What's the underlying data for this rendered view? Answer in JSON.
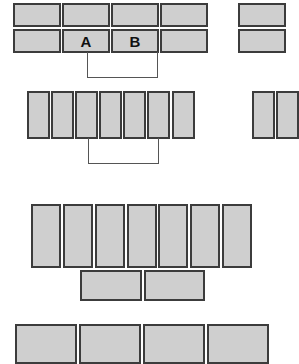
{
  "diagram": {
    "colors": {
      "box_fill": "#cfcfcf",
      "box_border": "#3c3c3c",
      "connector": "#555555",
      "background": "#ffffff"
    },
    "groups": [
      {
        "name": "top-grid",
        "boxes": [
          {
            "x": 13,
            "y": 3,
            "w": 48,
            "h": 24,
            "label": ""
          },
          {
            "x": 62,
            "y": 3,
            "w": 48,
            "h": 24,
            "label": ""
          },
          {
            "x": 111,
            "y": 3,
            "w": 48,
            "h": 24,
            "label": ""
          },
          {
            "x": 160,
            "y": 3,
            "w": 48,
            "h": 24,
            "label": ""
          },
          {
            "x": 13,
            "y": 29,
            "w": 48,
            "h": 24,
            "label": ""
          },
          {
            "x": 62,
            "y": 29,
            "w": 48,
            "h": 24,
            "label": "A"
          },
          {
            "x": 111,
            "y": 29,
            "w": 48,
            "h": 24,
            "label": "B"
          },
          {
            "x": 160,
            "y": 29,
            "w": 48,
            "h": 24,
            "label": ""
          },
          {
            "x": 238,
            "y": 3,
            "w": 48,
            "h": 24,
            "label": ""
          },
          {
            "x": 238,
            "y": 29,
            "w": 48,
            "h": 24,
            "label": ""
          }
        ],
        "connector": {
          "x1": 87,
          "x2": 158,
          "y_top": 52,
          "y_bottom": 78
        }
      },
      {
        "name": "tall-row",
        "boxes": [
          {
            "x": 27,
            "y": 91,
            "w": 23,
            "h": 48,
            "label": ""
          },
          {
            "x": 51,
            "y": 91,
            "w": 23,
            "h": 48,
            "label": ""
          },
          {
            "x": 75,
            "y": 91,
            "w": 23,
            "h": 48,
            "label": ""
          },
          {
            "x": 99,
            "y": 91,
            "w": 23,
            "h": 48,
            "label": ""
          },
          {
            "x": 123,
            "y": 91,
            "w": 23,
            "h": 48,
            "label": ""
          },
          {
            "x": 147,
            "y": 91,
            "w": 23,
            "h": 48,
            "label": ""
          },
          {
            "x": 172,
            "y": 91,
            "w": 23,
            "h": 48,
            "label": ""
          },
          {
            "x": 252,
            "y": 91,
            "w": 23,
            "h": 48,
            "label": ""
          },
          {
            "x": 276,
            "y": 91,
            "w": 23,
            "h": 48,
            "label": ""
          }
        ],
        "connector": {
          "x1": 88,
          "x2": 159,
          "y_top": 138,
          "y_bottom": 164
        }
      },
      {
        "name": "large-row",
        "boxes": [
          {
            "x": 31,
            "y": 204,
            "w": 30,
            "h": 64,
            "label": ""
          },
          {
            "x": 63,
            "y": 204,
            "w": 30,
            "h": 64,
            "label": ""
          },
          {
            "x": 95,
            "y": 204,
            "w": 30,
            "h": 64,
            "label": ""
          },
          {
            "x": 127,
            "y": 204,
            "w": 30,
            "h": 64,
            "label": ""
          },
          {
            "x": 158,
            "y": 204,
            "w": 30,
            "h": 64,
            "label": ""
          },
          {
            "x": 190,
            "y": 204,
            "w": 30,
            "h": 64,
            "label": ""
          },
          {
            "x": 222,
            "y": 204,
            "w": 30,
            "h": 64,
            "label": ""
          },
          {
            "x": 80,
            "y": 270,
            "w": 62,
            "h": 31,
            "label": ""
          },
          {
            "x": 144,
            "y": 270,
            "w": 61,
            "h": 31,
            "label": ""
          }
        ]
      },
      {
        "name": "bottom-row",
        "boxes": [
          {
            "x": 15,
            "y": 324,
            "w": 62,
            "h": 40,
            "label": ""
          },
          {
            "x": 79,
            "y": 324,
            "w": 62,
            "h": 40,
            "label": ""
          },
          {
            "x": 143,
            "y": 324,
            "w": 62,
            "h": 40,
            "label": ""
          },
          {
            "x": 207,
            "y": 324,
            "w": 62,
            "h": 40,
            "label": ""
          }
        ]
      }
    ]
  }
}
